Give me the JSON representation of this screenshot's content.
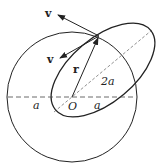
{
  "diagram": {
    "labels": {
      "v_outer": "v",
      "v_inner": "v",
      "r": "r",
      "two_a": "2a",
      "a_left": "a",
      "origin": "O",
      "a_right": "a"
    },
    "colors": {
      "stroke": "#222222",
      "dashed": "#444444",
      "background": "#ffffff"
    }
  }
}
